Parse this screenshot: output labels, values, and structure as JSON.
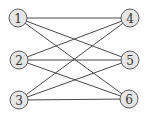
{
  "graph": {
    "type": "complete-bipartite",
    "name": "K3,3",
    "colors": {
      "edge": "#4a4a4a",
      "node_fill": "#e6e6e6",
      "node_stroke": "#5a5a5a",
      "label": "#333333"
    },
    "nodes": [
      {
        "id": "1",
        "label": "1",
        "x": 18,
        "y": 18
      },
      {
        "id": "2",
        "label": "2",
        "x": 19,
        "y": 60
      },
      {
        "id": "3",
        "label": "3",
        "x": 19,
        "y": 100
      },
      {
        "id": "4",
        "label": "4",
        "x": 130,
        "y": 18
      },
      {
        "id": "5",
        "label": "5",
        "x": 130,
        "y": 60
      },
      {
        "id": "6",
        "label": "6",
        "x": 129,
        "y": 99
      }
    ],
    "edges": [
      [
        "1",
        "4"
      ],
      [
        "1",
        "5"
      ],
      [
        "1",
        "6"
      ],
      [
        "2",
        "4"
      ],
      [
        "2",
        "5"
      ],
      [
        "2",
        "6"
      ],
      [
        "3",
        "4"
      ],
      [
        "3",
        "5"
      ],
      [
        "3",
        "6"
      ]
    ]
  }
}
